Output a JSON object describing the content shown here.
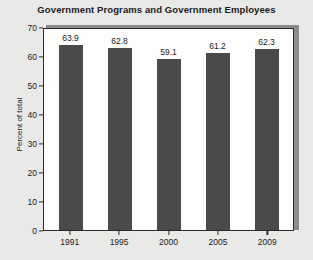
{
  "chart_data": {
    "type": "bar",
    "title": "Government Programs and Government Employees",
    "xlabel": "",
    "ylabel": "Percent of total",
    "categories": [
      "1991",
      "1995",
      "2000",
      "2005",
      "2009"
    ],
    "values": [
      63.9,
      62.8,
      59.1,
      61.2,
      62.3
    ],
    "value_labels": [
      "63.9",
      "62.8",
      "59.1",
      "61.2",
      "62.3"
    ],
    "ylim": [
      0,
      70
    ],
    "yticks": [
      0,
      10,
      20,
      30,
      40,
      50,
      60,
      70
    ],
    "ytick_labels": [
      "0",
      "10",
      "20",
      "30",
      "40",
      "50",
      "60",
      "70"
    ],
    "grid": false,
    "legend": false,
    "bar_color": "#4a4a4a",
    "plot_background": "#fdfdfb",
    "figure_background": "#e9e9e7",
    "axis_color": "#2a2a2a",
    "text_color": "#1b1b1b"
  }
}
